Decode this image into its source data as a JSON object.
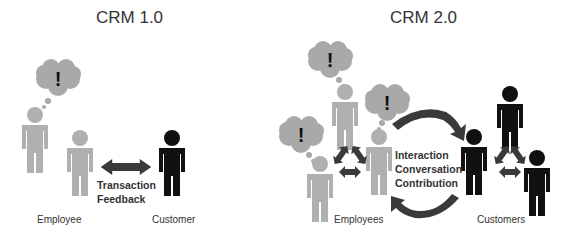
{
  "colors": {
    "employee": "#b0b0b0",
    "customer": "#111111",
    "cloud": "#a9a9a9",
    "arrow": "#3a3a3a",
    "text": "#333333"
  },
  "left_panel": {
    "title": "CRM 1.0",
    "employee_label": "Employee",
    "customer_label": "Customer",
    "arrow_label_lines": [
      "Transaction",
      "Feedback"
    ],
    "thought_symbol": "!"
  },
  "right_panel": {
    "title": "CRM 2.0",
    "employees_label": "Employees",
    "customers_label": "Customers",
    "interaction_lines": [
      "Interaction",
      "Conversation",
      "Contribution"
    ],
    "thought_symbol": "!"
  },
  "icons": [
    "person-icon",
    "thought-cloud-icon",
    "double-arrow-icon",
    "cycle-arrows-icon",
    "curved-arrow-icon"
  ]
}
